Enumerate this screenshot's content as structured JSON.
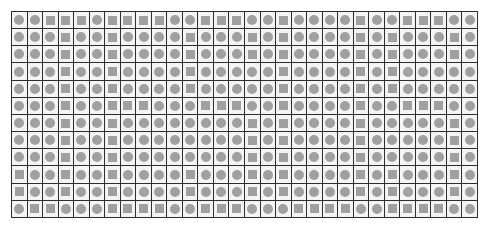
{
  "grid": {
    "rows": 12,
    "cols": 30,
    "legend": {
      "C": "circle",
      "S": "square"
    },
    "colors": {
      "line": "#2e2e2e",
      "cell": "#f4f4f4",
      "shape": "#a0a0a0",
      "background": "#ffffff"
    },
    "cells": [
      "CCSSSCSSSSCCSSSCCSCCCCSCCSSSCC",
      "CCCSCCSCCCCSCCCSCSCCCCSCSCCCSC",
      "CCCSCCSCCCCSCCCSCSCCCCSCSCCCSC",
      "CCCSCCSCCCCSCCCCCSCCCCSCSCCCCC",
      "CCCSCCSCCCCSCCCCCSCCCCSCSCCCCC",
      "CCCSCCSSSCCCSSSCCSCCCCSCCSSSCC",
      "CCCSCCSCCCCCCCCSCSCCCCSCCCCCSC",
      "CCCSCCSCCCCCCCCSCSCCCCSCCCCCSC",
      "CCCSCCSCCCCCCCCSCSCCCCSCCCCCSC",
      "SCCSCCSCCCCSCCCSCSCCCCSCSCCCSC",
      "SCCSCCSCCCCSCCCSCSCCCCSCSCCCSC",
      "CSSCCCSSSSCCSSSCCCSSSSCCSSSSCC"
    ]
  }
}
